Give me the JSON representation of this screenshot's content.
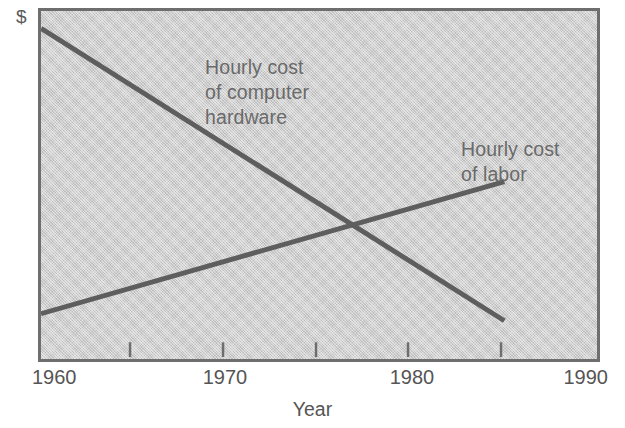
{
  "chart_data": {
    "type": "line",
    "title": "",
    "subtitle": "",
    "xlabel": "Year",
    "ylabel": "Dollar costs",
    "y_unit_symbol": "$",
    "xlim": [
      1960,
      1990
    ],
    "ylim": [
      0,
      100
    ],
    "grid": false,
    "legend_position": "inline-annotations",
    "x_ticks_major": [
      1960,
      1970,
      1980,
      1990
    ],
    "x_tick_labels": [
      "1960",
      "1970",
      "1980",
      "1990"
    ],
    "x_ticks_minor": [
      1965,
      1970,
      1975,
      1980,
      1985
    ],
    "y_ticks": [],
    "y_tick_labels": [],
    "series": [
      {
        "name": "Hourly cost of computer hardware",
        "annotation_text": "Hourly cost\nof computer\nhardware",
        "color": "#5e5e5e",
        "x": [
          1960,
          1985
        ],
        "values": [
          95,
          11
        ],
        "points": [
          {
            "x": 1960,
            "y": 95
          },
          {
            "x": 1985,
            "y": 11
          }
        ]
      },
      {
        "name": "Hourly cost of labor",
        "annotation_text": "Hourly cost\nof labor",
        "color": "#5e5e5e",
        "x": [
          1960,
          1985
        ],
        "values": [
          13,
          51
        ],
        "points": [
          {
            "x": 1960,
            "y": 13
          },
          {
            "x": 1985,
            "y": 51
          }
        ]
      }
    ],
    "annotations": [
      {
        "id": "crossover",
        "x": 1977,
        "y": 39,
        "label": ""
      }
    ],
    "colors": {
      "plot_background": "#cfcfcf",
      "frame": "#6e6e6e",
      "line": "#5e5e5e",
      "text": "#555555",
      "page_background": "#ffffff"
    }
  }
}
